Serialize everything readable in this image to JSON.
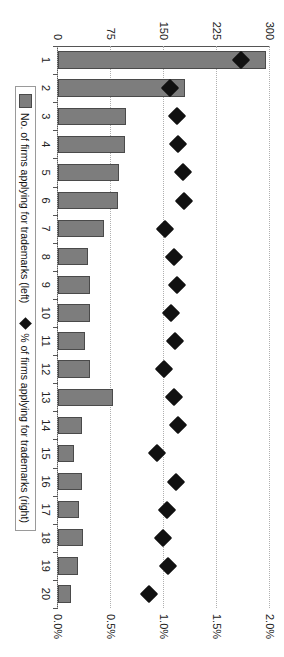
{
  "chart_data": {
    "type": "bar",
    "title": "",
    "xlabel": "",
    "ylabel": "",
    "grid": true,
    "legend_position": "bottom",
    "categories": [
      "1",
      "2",
      "3",
      "4",
      "5",
      "6",
      "7",
      "8",
      "9",
      "10",
      "11",
      "12",
      "13",
      "14",
      "15",
      "16",
      "17",
      "18",
      "19",
      "20"
    ],
    "axes": {
      "left": {
        "label": "No. of firms applying for trademarks",
        "ticks": [
          "0",
          "75",
          "150",
          "225",
          "300"
        ],
        "tick_values": [
          0,
          75,
          150,
          225,
          300
        ],
        "lim": [
          0,
          300
        ]
      },
      "right": {
        "label": "% of firms applying for trademarks",
        "ticks": [
          "0.0%",
          "0.5%",
          "1.0%",
          "1.5%",
          "2.0%"
        ],
        "tick_values": [
          0.0,
          0.5,
          1.0,
          1.5,
          2.0
        ],
        "lim": [
          0,
          2.0
        ]
      }
    },
    "series": [
      {
        "name": "No. of firms applying for trademarks (left)",
        "type": "bar",
        "axis": "left",
        "color": "#7d7d7d",
        "values": [
          295,
          180,
          96,
          95,
          86,
          85,
          65,
          43,
          45,
          46,
          38,
          45,
          78,
          34,
          22,
          34,
          30,
          36,
          28,
          18
        ]
      },
      {
        "name": "% of firms applying for trademarks (right)",
        "type": "scatter",
        "axis": "right",
        "color": "#111111",
        "marker": "diamond",
        "values": [
          1.73,
          1.06,
          1.12,
          1.13,
          1.18,
          1.19,
          1.01,
          1.09,
          1.12,
          1.07,
          1.1,
          1.0,
          1.09,
          1.13,
          0.93,
          1.11,
          1.03,
          0.99,
          1.04,
          0.86
        ]
      }
    ]
  },
  "legend": {
    "items": [
      {
        "label": "No. of firms applying for trademarks (left)",
        "marker": "bar-swatch"
      },
      {
        "label": "% of firms applying for trademarks (right)",
        "marker": "diamond-marker"
      }
    ]
  }
}
